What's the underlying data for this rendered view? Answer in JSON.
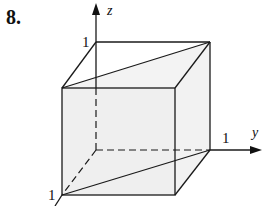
{
  "problem": {
    "number": "8."
  },
  "axes": {
    "z": {
      "label": "z",
      "tick": "1"
    },
    "y": {
      "label": "y",
      "tick": "1"
    },
    "x": {
      "tick": "1"
    }
  },
  "colors": {
    "line": "#1a1a1a",
    "face": "#eeeeee"
  }
}
